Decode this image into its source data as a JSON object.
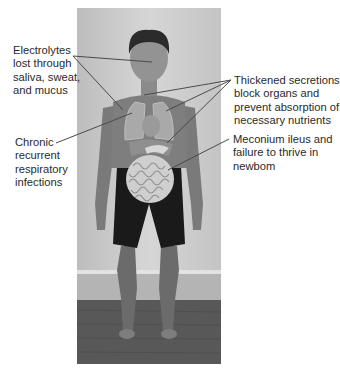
{
  "figure": {
    "background_color": "#ffffff",
    "photo_bg_color": "#c9c9c9",
    "leader_line_color": "#4a4a4a"
  },
  "labels": {
    "electrolytes": {
      "lines": [
        "Electrolytes",
        "lost through",
        "saliva, sweat,",
        "and mucus"
      ]
    },
    "chronic": {
      "lines": [
        "Chronic",
        "recurrent",
        "respiratory",
        "infections"
      ]
    },
    "thickened": {
      "lines": [
        "Thickened secretions",
        "block organs and",
        "prevent absorption of",
        "necessary nutrients"
      ]
    },
    "meconium": {
      "lines": [
        "Meconium ileus and",
        "failure to thrive in",
        "newbom"
      ]
    }
  }
}
